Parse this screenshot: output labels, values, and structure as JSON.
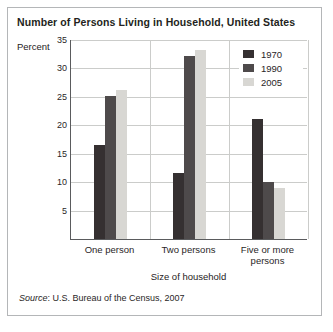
{
  "figure": {
    "title": "Number of Persons Living in Household, United States",
    "y_axis_label": "Percent",
    "x_axis_title": "Size of household",
    "source_label": "Source",
    "source_rest": ":  U.S. Bureau of the Census, 2007"
  },
  "chart_data": {
    "type": "bar",
    "title": "Number of Persons Living in Household, United States",
    "xlabel": "Size of household",
    "ylabel": "Percent",
    "categories": [
      "One person",
      "Two persons",
      "Five or more persons"
    ],
    "series": [
      {
        "name": "1970",
        "color": "#353031",
        "values": [
          16.5,
          11.5,
          21
        ]
      },
      {
        "name": "1990",
        "color": "#4e4a4b",
        "values": [
          25,
          32,
          10
        ]
      },
      {
        "name": "2005",
        "color": "#d8d7d3",
        "values": [
          26,
          33,
          9
        ]
      }
    ],
    "ylim": [
      0,
      35
    ],
    "yticks": [
      5,
      10,
      15,
      20,
      25,
      30,
      35
    ],
    "grid": true,
    "legend_position": "top-right",
    "source": "U.S. Bureau of the Census, 2007"
  },
  "colors": {
    "grid": "#cbccca",
    "axis": "#5a5b5d",
    "border": "#b4b6b8",
    "background": "#ffffff",
    "text": "#2a2627"
  }
}
